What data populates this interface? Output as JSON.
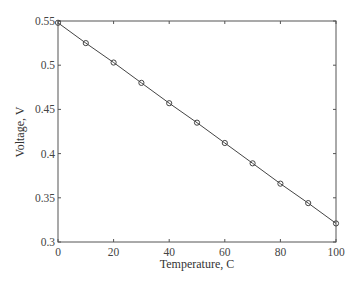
{
  "chart_data": {
    "type": "line",
    "title": "",
    "xlabel": "Temperature, C",
    "ylabel": "Voltage, V",
    "xlim": [
      0,
      100
    ],
    "ylim": [
      0.3,
      0.55
    ],
    "x_ticks": [
      0,
      20,
      40,
      60,
      80,
      100
    ],
    "x_tick_labels": [
      "0",
      "20",
      "40",
      "60",
      "80",
      "100"
    ],
    "y_ticks": [
      0.3,
      0.35,
      0.4,
      0.45,
      0.5,
      0.55
    ],
    "y_tick_labels": [
      "0.3",
      "0.35",
      "0.4",
      "0.45",
      "0.5",
      "0.55"
    ],
    "grid": false,
    "legend": null,
    "series": [
      {
        "name": "Voltage vs Temperature",
        "marker": "circle",
        "line": "solid",
        "color": "#444444",
        "x": [
          0,
          10,
          20,
          30,
          40,
          50,
          60,
          70,
          80,
          90,
          100
        ],
        "y": [
          0.548,
          0.525,
          0.503,
          0.48,
          0.457,
          0.435,
          0.412,
          0.389,
          0.366,
          0.344,
          0.321
        ]
      }
    ]
  }
}
